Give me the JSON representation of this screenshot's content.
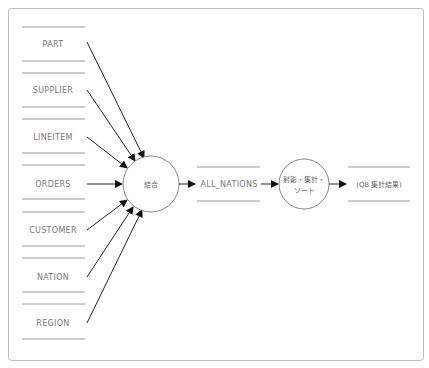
{
  "diagram": {
    "type": "data-flow",
    "sources": [
      {
        "label": "PART",
        "y": 44
      },
      {
        "label": "SUPPLIER",
        "y": 90
      },
      {
        "label": "LINEITEM",
        "y": 137
      },
      {
        "label": "ORDERS",
        "y": 184
      },
      {
        "label": "CUSTOMER",
        "y": 230
      },
      {
        "label": "NATION",
        "y": 277
      },
      {
        "label": "REGION",
        "y": 323
      }
    ],
    "process_join": {
      "label": "結合"
    },
    "intermediate_store": {
      "label": "ALL_NATIONS"
    },
    "process_final": {
      "label_line1": "射影・集計・",
      "label_line2": "ソート"
    },
    "output_store": {
      "label": "(Q8 集計結果)"
    },
    "colors": {
      "frame": "#bbbbbb",
      "store_line": "#999999",
      "arrow": "#222222",
      "circle": "#888888",
      "text": "#777777"
    }
  }
}
